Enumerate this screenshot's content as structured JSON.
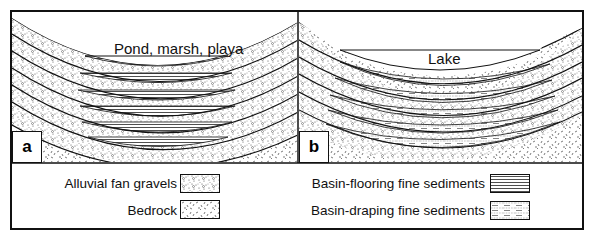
{
  "figure": {
    "panels": [
      {
        "id": "a",
        "letter": "a",
        "label": "Pond, marsh, playa"
      },
      {
        "id": "b",
        "letter": "b",
        "label": "Lake"
      }
    ]
  },
  "legend": {
    "items": [
      {
        "label": "Alluvial fan gravels",
        "pattern": "dotted-with-circles"
      },
      {
        "label": "Bedrock",
        "pattern": "random-ticks"
      },
      {
        "label": "Basin-flooring fine sediments",
        "pattern": "horizontal-lines"
      },
      {
        "label": "Basin-draping fine sediments",
        "pattern": "dotted-dashed-lines"
      }
    ]
  },
  "colors": {
    "line": "#111111",
    "background": "#ffffff"
  }
}
